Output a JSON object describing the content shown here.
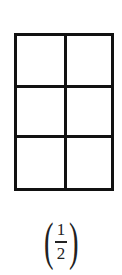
{
  "diagram": {
    "grid": {
      "rows": 3,
      "cols": 2,
      "line_color": "#111111"
    },
    "label": {
      "open": "(",
      "numerator": "1",
      "denominator": "2",
      "close": ")"
    }
  }
}
